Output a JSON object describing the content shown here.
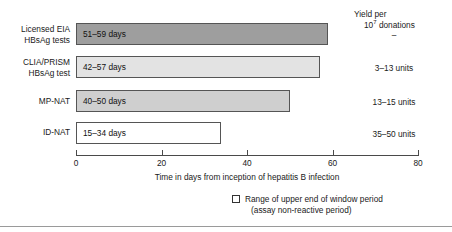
{
  "chart_data": {
    "type": "bar",
    "orientation": "horizontal",
    "title": "",
    "xlabel": "Time in days from inception of hepatitis B infection",
    "ylabel": "",
    "xlim": [
      0,
      80
    ],
    "xticks": [
      0,
      20,
      40,
      60,
      80
    ],
    "xtick_labels": [
      "0",
      "20",
      "40",
      "60",
      "80"
    ],
    "grid": false,
    "categories": [
      "Licensed EIA HBsAg tests",
      "CLIA/PRISM HBsAg test",
      "MP-NAT",
      "ID-NAT"
    ],
    "bars": [
      {
        "category_line1": "Licensed EIA",
        "category_line2": "HBsAg tests",
        "range_label": "51–59 days",
        "low": 51,
        "high": 59,
        "value": 59,
        "fill": "#9e9e9e",
        "stroke": "#555555",
        "yield_label": "–"
      },
      {
        "category_line1": "CLIA/PRISM",
        "category_line2": "HBsAg test",
        "range_label": "42–57 days",
        "low": 42,
        "high": 57,
        "value": 57,
        "fill": "#e3e3e3",
        "stroke": "#555555",
        "yield_label": "3–13 units"
      },
      {
        "category_line1": "MP-NAT",
        "category_line2": "",
        "range_label": "40–50 days",
        "low": 40,
        "high": 50,
        "value": 50,
        "fill": "#cfcfcf",
        "stroke": "#555555",
        "yield_label": "13–15 units"
      },
      {
        "category_line1": "ID-NAT",
        "category_line2": "",
        "range_label": "15–34 days",
        "low": 15,
        "high": 34,
        "value": 34,
        "fill": "#ffffff",
        "stroke": "#555555",
        "yield_label": "35–50 units"
      }
    ],
    "annotations": {
      "yield_header_line1": "Yield per",
      "yield_header_line2_base": "10",
      "yield_header_line2_sup": "7",
      "yield_header_line2_rest": " donations"
    },
    "legend": {
      "position": "bottom-right",
      "entries": [
        {
          "swatch_fill": "#ffffff",
          "swatch_stroke": "#333333",
          "line1": "Range of upper end of window period",
          "line2": "(assay non-reactive period)"
        }
      ]
    }
  }
}
